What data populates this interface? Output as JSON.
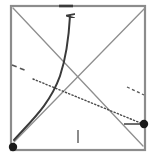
{
  "figure": {
    "title": "",
    "background": "#ffffff",
    "width": 156,
    "height": 162,
    "frame": {
      "name": "plot-frame",
      "x": 11,
      "y": 6,
      "width": 134,
      "height": 144,
      "stroke": "#8c8c8c",
      "stroke_width": 2.2
    },
    "colors": {
      "frame": "#8c8c8c",
      "gray_line": "#8f8f8f",
      "dark_curve": "#3a3a3a",
      "dotted_line": "#4a4a4a",
      "marker": "#1a1a1a",
      "tick": "#6e6e6e",
      "dash_mark": "#555555"
    }
  },
  "chart_data": {
    "type": "line",
    "title": "",
    "subtitle": "",
    "xlabel": "",
    "ylabel": "",
    "xlim": [
      0,
      156
    ],
    "ylim": [
      162,
      0
    ],
    "grid": false,
    "legend": null,
    "annotations": [],
    "series": [
      {
        "name": "upward-gray-line",
        "style": "solid",
        "color": "#8f8f8f",
        "width": 1.3,
        "points": [
          [
            14,
            142
          ],
          [
            145,
            8
          ]
        ]
      },
      {
        "name": "downward-gray-line",
        "style": "solid",
        "color": "#8f8f8f",
        "width": 1.3,
        "points": [
          [
            13,
            8
          ],
          [
            143,
            146
          ]
        ]
      },
      {
        "name": "dotted-line",
        "style": "dotted",
        "color": "#4a4a4a",
        "width": 1.4,
        "points": [
          [
            33,
            79
          ],
          [
            143,
            124
          ]
        ]
      },
      {
        "name": "dark-curve-arrow",
        "style": "solid-curve-arrow",
        "color": "#3a3a3a",
        "width": 2.0,
        "points": [
          [
            14,
            140
          ],
          [
            38,
            112
          ],
          [
            55,
            82
          ],
          [
            66,
            46
          ],
          [
            70,
            14
          ]
        ],
        "arrow_at": "end"
      },
      {
        "name": "left-dash-segment",
        "style": "dashed",
        "color": "#555555",
        "width": 1.6,
        "points": [
          [
            12,
            65
          ],
          [
            27,
            71
          ]
        ]
      },
      {
        "name": "right-dash-segment",
        "style": "dashed",
        "color": "#555555",
        "width": 1.3,
        "points": [
          [
            127,
            87
          ],
          [
            144,
            95
          ]
        ]
      }
    ],
    "markers": [
      {
        "name": "origin-marker",
        "x": 13,
        "y": 147,
        "radius": 4.2,
        "color": "#1a1a1a"
      },
      {
        "name": "right-edge-marker",
        "x": 144,
        "y": 124,
        "radius": 4.2,
        "color": "#1a1a1a"
      }
    ],
    "ticks": [
      {
        "name": "top-axis-tick",
        "axis": "top",
        "x": 66,
        "y": 6,
        "length": 14,
        "orientation": "horizontal",
        "width": 2.4
      },
      {
        "name": "bottom-axis-tick",
        "axis": "bottom",
        "x": 78,
        "y": 132,
        "length": 13,
        "orientation": "vertical",
        "width": 1.6
      },
      {
        "name": "right-edge-pointer-tick",
        "axis": "right",
        "x": 124,
        "y": 124,
        "length": 20,
        "orientation": "horizontal",
        "width": 1.6
      }
    ]
  }
}
